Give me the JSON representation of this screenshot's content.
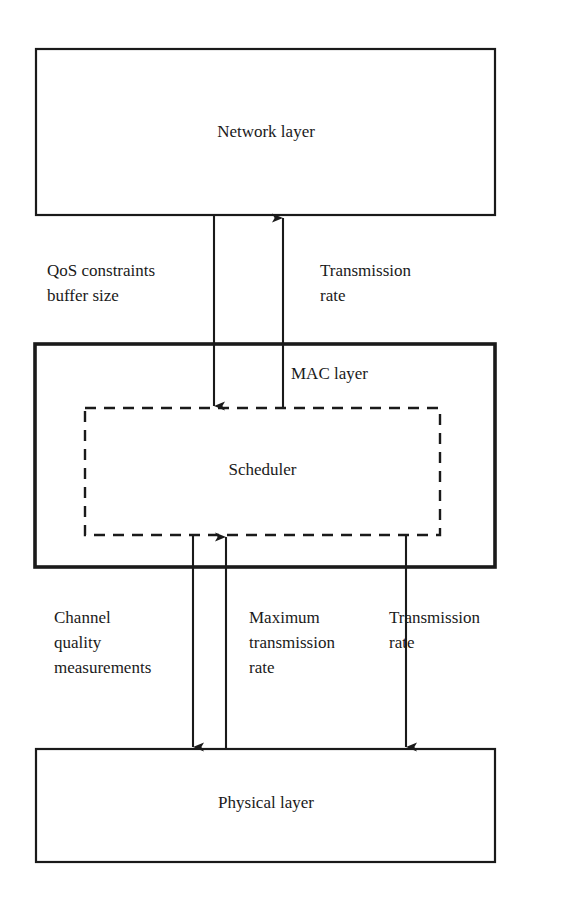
{
  "diagram": {
    "colors": {
      "stroke": "#1a1a1a",
      "background": "#ffffff"
    },
    "boxes": [
      {
        "id": "network",
        "label": "Network layer",
        "border": "solid",
        "name": "network-layer-box"
      },
      {
        "id": "mac",
        "label": "MAC layer",
        "border": "solid-thick",
        "name": "mac-layer-box"
      },
      {
        "id": "scheduler",
        "label": "Scheduler",
        "border": "dashed",
        "name": "scheduler-box"
      },
      {
        "id": "physical",
        "label": "Physical layer",
        "border": "solid",
        "name": "physical-layer-box"
      }
    ],
    "arrows": [
      {
        "id": "qos",
        "from": "network",
        "to": "scheduler",
        "direction": "down",
        "label_lines": [
          "QoS constraints",
          "buffer size"
        ]
      },
      {
        "id": "tx_up_to_network",
        "from": "mac",
        "to": "network",
        "direction": "up",
        "label_lines": [
          "Transmission",
          "rate"
        ]
      },
      {
        "id": "channel_quality",
        "from": "scheduler",
        "to": "physical",
        "direction": "down",
        "label_lines": [
          "Channel",
          "quality",
          "measurements"
        ]
      },
      {
        "id": "max_tx_rate",
        "from": "physical",
        "to": "scheduler",
        "direction": "up",
        "label_lines": [
          "Maximum",
          "transmission",
          "rate"
        ]
      },
      {
        "id": "tx_down_to_physical",
        "from": "scheduler",
        "to": "physical",
        "direction": "down",
        "label_lines": [
          "Transmission",
          "rate"
        ]
      }
    ]
  }
}
